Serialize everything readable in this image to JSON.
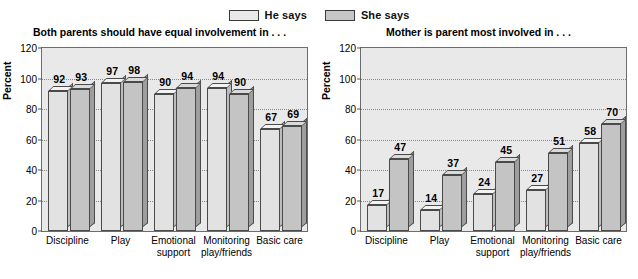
{
  "legend": {
    "entries": [
      {
        "label": "He says",
        "color": "#e9e9e9",
        "icon": "legend-swatch-he-says"
      },
      {
        "label": "She says",
        "color": "#c6c6c6",
        "icon": "legend-swatch-she-says"
      }
    ]
  },
  "chart_data": [
    {
      "type": "bar",
      "title": "Both parents should have equal involvement in . . .",
      "xlabel": "",
      "ylabel": "Percent",
      "ylim": [
        0,
        120
      ],
      "yticks": [
        0,
        20,
        40,
        60,
        80,
        100,
        120
      ],
      "grid": true,
      "legend_position": "top-center",
      "categories": [
        "Discipline",
        "Play",
        "Emotional support",
        "Monitoring play/friends",
        "Basic care"
      ],
      "series": [
        {
          "name": "He says",
          "values": [
            92,
            97,
            90,
            94,
            67
          ]
        },
        {
          "name": "She says",
          "values": [
            93,
            98,
            94,
            90,
            69
          ]
        }
      ]
    },
    {
      "type": "bar",
      "title": "Mother is parent most involved in . . .",
      "xlabel": "",
      "ylabel": "Percent",
      "ylim": [
        0,
        120
      ],
      "yticks": [
        0,
        20,
        40,
        60,
        80,
        100,
        120
      ],
      "grid": true,
      "legend_position": "top-center",
      "categories": [
        "Discipline",
        "Play",
        "Emotional support",
        "Monitoring play/friends",
        "Basic care"
      ],
      "series": [
        {
          "name": "He says",
          "values": [
            17,
            14,
            24,
            27,
            58
          ]
        },
        {
          "name": "She says",
          "values": [
            47,
            37,
            45,
            51,
            70
          ]
        }
      ]
    }
  ]
}
